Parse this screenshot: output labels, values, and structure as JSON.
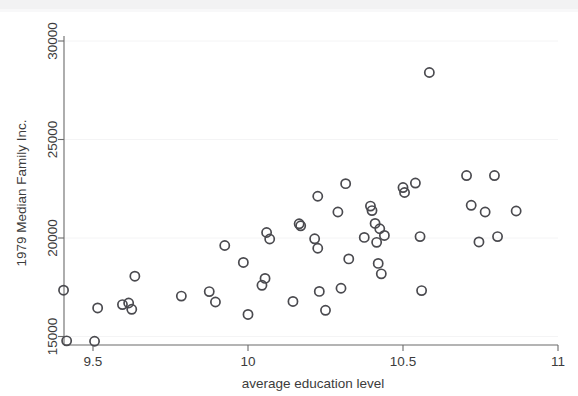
{
  "chart_data": {
    "type": "scatter",
    "title": "",
    "xlabel": "average education level",
    "ylabel": "1979 Median Family Inc.",
    "xlim": [
      9.39,
      11.0
    ],
    "ylim": [
      14500,
      30600
    ],
    "xticks": [
      9.5,
      10,
      10.5,
      11
    ],
    "xticklabels": [
      "9.5",
      "10",
      "10.5",
      "11"
    ],
    "yticks": [
      15000,
      20000,
      25000,
      30000
    ],
    "yticklabels": [
      "15000",
      "20000",
      "25000",
      "30000"
    ],
    "grid": false,
    "legend": "none",
    "marker": "open-circle",
    "marker_color": "#4a4a4f",
    "n_points": 52,
    "points": [
      {
        "x": 9.405,
        "y": 17350
      },
      {
        "x": 9.415,
        "y": 14780
      },
      {
        "x": 9.505,
        "y": 14760
      },
      {
        "x": 9.515,
        "y": 16450
      },
      {
        "x": 9.595,
        "y": 16620
      },
      {
        "x": 9.615,
        "y": 16700
      },
      {
        "x": 9.625,
        "y": 16380
      },
      {
        "x": 9.635,
        "y": 18060
      },
      {
        "x": 9.785,
        "y": 17050
      },
      {
        "x": 9.875,
        "y": 17280
      },
      {
        "x": 9.895,
        "y": 16750
      },
      {
        "x": 9.925,
        "y": 19620
      },
      {
        "x": 9.985,
        "y": 18760
      },
      {
        "x": 10.0,
        "y": 16120
      },
      {
        "x": 10.045,
        "y": 17600
      },
      {
        "x": 10.055,
        "y": 17950
      },
      {
        "x": 10.06,
        "y": 20280
      },
      {
        "x": 10.07,
        "y": 19950
      },
      {
        "x": 10.145,
        "y": 16780
      },
      {
        "x": 10.165,
        "y": 20720
      },
      {
        "x": 10.17,
        "y": 20620
      },
      {
        "x": 10.215,
        "y": 19960
      },
      {
        "x": 10.225,
        "y": 19480
      },
      {
        "x": 10.225,
        "y": 22120
      },
      {
        "x": 10.23,
        "y": 17290
      },
      {
        "x": 10.25,
        "y": 16330
      },
      {
        "x": 10.29,
        "y": 21320
      },
      {
        "x": 10.3,
        "y": 17450
      },
      {
        "x": 10.315,
        "y": 22760
      },
      {
        "x": 10.325,
        "y": 18940
      },
      {
        "x": 10.375,
        "y": 20030
      },
      {
        "x": 10.395,
        "y": 21620
      },
      {
        "x": 10.4,
        "y": 21390
      },
      {
        "x": 10.41,
        "y": 20740
      },
      {
        "x": 10.415,
        "y": 19780
      },
      {
        "x": 10.42,
        "y": 18710
      },
      {
        "x": 10.425,
        "y": 20470
      },
      {
        "x": 10.43,
        "y": 18180
      },
      {
        "x": 10.44,
        "y": 20130
      },
      {
        "x": 10.5,
        "y": 22560
      },
      {
        "x": 10.505,
        "y": 22310
      },
      {
        "x": 10.54,
        "y": 22790
      },
      {
        "x": 10.555,
        "y": 20070
      },
      {
        "x": 10.56,
        "y": 17330
      },
      {
        "x": 10.585,
        "y": 28400
      },
      {
        "x": 10.705,
        "y": 23170
      },
      {
        "x": 10.72,
        "y": 21660
      },
      {
        "x": 10.745,
        "y": 19800
      },
      {
        "x": 10.765,
        "y": 21320
      },
      {
        "x": 10.795,
        "y": 23170
      },
      {
        "x": 10.805,
        "y": 20070
      },
      {
        "x": 10.865,
        "y": 21370
      }
    ]
  }
}
